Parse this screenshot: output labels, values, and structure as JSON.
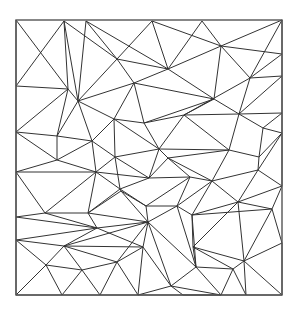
{
  "diagram": {
    "type": "triangulation-mesh",
    "canvas": {
      "width": 299,
      "height": 313
    },
    "colors": {
      "background": "#ffffff",
      "edge": "#333333",
      "border": "#555555"
    },
    "border": {
      "x": 16,
      "y": 20,
      "width": 266,
      "height": 275
    },
    "vertices": [
      [
        16,
        20
      ],
      [
        64,
        21
      ],
      [
        86,
        21
      ],
      [
        152,
        21
      ],
      [
        202,
        21
      ],
      [
        282,
        20
      ],
      [
        16,
        86
      ],
      [
        68,
        89
      ],
      [
        78,
        101
      ],
      [
        117,
        59
      ],
      [
        168,
        69
      ],
      [
        134,
        83
      ],
      [
        221,
        46
      ],
      [
        282,
        54
      ],
      [
        250,
        78
      ],
      [
        282,
        76
      ],
      [
        214,
        99
      ],
      [
        16,
        132
      ],
      [
        57,
        136
      ],
      [
        92,
        141
      ],
      [
        57,
        160
      ],
      [
        16,
        172
      ],
      [
        96,
        172
      ],
      [
        114,
        119
      ],
      [
        144,
        123
      ],
      [
        184,
        115
      ],
      [
        159,
        149
      ],
      [
        115,
        157
      ],
      [
        168,
        158
      ],
      [
        149,
        178
      ],
      [
        190,
        177
      ],
      [
        120,
        189
      ],
      [
        239,
        114
      ],
      [
        282,
        113
      ],
      [
        263,
        128
      ],
      [
        282,
        133
      ],
      [
        229,
        150
      ],
      [
        259,
        157
      ],
      [
        258,
        170
      ],
      [
        282,
        186
      ],
      [
        212,
        181
      ],
      [
        16,
        217
      ],
      [
        45,
        213
      ],
      [
        88,
        213
      ],
      [
        16,
        240
      ],
      [
        64,
        246
      ],
      [
        46,
        265
      ],
      [
        82,
        270
      ],
      [
        16,
        295
      ],
      [
        62,
        295
      ],
      [
        100,
        295
      ],
      [
        97,
        228
      ],
      [
        121,
        191
      ],
      [
        146,
        206
      ],
      [
        177,
        206
      ],
      [
        192,
        215
      ],
      [
        148,
        222
      ],
      [
        143,
        247
      ],
      [
        117,
        262
      ],
      [
        196,
        267
      ],
      [
        171,
        286
      ],
      [
        138,
        295
      ],
      [
        183,
        295
      ],
      [
        238,
        202
      ],
      [
        272,
        209
      ],
      [
        193,
        247
      ],
      [
        244,
        261
      ],
      [
        282,
        243
      ],
      [
        233,
        269
      ],
      [
        221,
        295
      ],
      [
        246,
        295
      ],
      [
        282,
        295
      ]
    ],
    "edges": [
      [
        0,
        7
      ],
      [
        0,
        6
      ],
      [
        1,
        6
      ],
      [
        1,
        7
      ],
      [
        1,
        8
      ],
      [
        1,
        9
      ],
      [
        2,
        8
      ],
      [
        2,
        10
      ],
      [
        2,
        9
      ],
      [
        3,
        9
      ],
      [
        3,
        10
      ],
      [
        4,
        10
      ],
      [
        4,
        12
      ],
      [
        3,
        12
      ],
      [
        5,
        12
      ],
      [
        5,
        13
      ],
      [
        12,
        13
      ],
      [
        12,
        14
      ],
      [
        13,
        14
      ],
      [
        14,
        15
      ],
      [
        5,
        14
      ],
      [
        12,
        16
      ],
      [
        10,
        12
      ],
      [
        10,
        16
      ],
      [
        9,
        10
      ],
      [
        9,
        11
      ],
      [
        10,
        11
      ],
      [
        11,
        16
      ],
      [
        8,
        11
      ],
      [
        8,
        9
      ],
      [
        7,
        8
      ],
      [
        6,
        7
      ],
      [
        6,
        17
      ],
      [
        7,
        17
      ],
      [
        7,
        18
      ],
      [
        8,
        18
      ],
      [
        8,
        19
      ],
      [
        8,
        23
      ],
      [
        11,
        23
      ],
      [
        11,
        24
      ],
      [
        16,
        24
      ],
      [
        16,
        25
      ],
      [
        14,
        25
      ],
      [
        14,
        32
      ],
      [
        15,
        32
      ],
      [
        13,
        15
      ],
      [
        15,
        33
      ],
      [
        32,
        33
      ],
      [
        25,
        32
      ],
      [
        16,
        32
      ],
      [
        24,
        25
      ],
      [
        23,
        24
      ],
      [
        19,
        23
      ],
      [
        18,
        19
      ],
      [
        17,
        18
      ],
      [
        17,
        20
      ],
      [
        18,
        20
      ],
      [
        19,
        20
      ],
      [
        19,
        22
      ],
      [
        20,
        22
      ],
      [
        20,
        21
      ],
      [
        21,
        22
      ],
      [
        17,
        21
      ],
      [
        23,
        27
      ],
      [
        19,
        27
      ],
      [
        22,
        27
      ],
      [
        23,
        26
      ],
      [
        24,
        26
      ],
      [
        25,
        26
      ],
      [
        26,
        27
      ],
      [
        26,
        28
      ],
      [
        25,
        36
      ],
      [
        26,
        36
      ],
      [
        32,
        36
      ],
      [
        32,
        34
      ],
      [
        33,
        34
      ],
      [
        34,
        35
      ],
      [
        33,
        35
      ],
      [
        34,
        37
      ],
      [
        36,
        37
      ],
      [
        35,
        37
      ],
      [
        35,
        38
      ],
      [
        37,
        38
      ],
      [
        38,
        39
      ],
      [
        35,
        39
      ],
      [
        36,
        40
      ],
      [
        28,
        36
      ],
      [
        28,
        40
      ],
      [
        26,
        29
      ],
      [
        28,
        29
      ],
      [
        27,
        29
      ],
      [
        22,
        29
      ],
      [
        27,
        31
      ],
      [
        29,
        31
      ],
      [
        22,
        31
      ],
      [
        29,
        30
      ],
      [
        28,
        30
      ],
      [
        30,
        40
      ],
      [
        38,
        40
      ],
      [
        30,
        54
      ],
      [
        40,
        54
      ],
      [
        40,
        55
      ],
      [
        55,
        63
      ],
      [
        40,
        63
      ],
      [
        38,
        63
      ],
      [
        39,
        63
      ],
      [
        39,
        64
      ],
      [
        63,
        64
      ],
      [
        21,
        42
      ],
      [
        21,
        41
      ],
      [
        42,
        41
      ],
      [
        22,
        42
      ],
      [
        22,
        43
      ],
      [
        42,
        43
      ],
      [
        31,
        43
      ],
      [
        31,
        52
      ],
      [
        43,
        52
      ],
      [
        52,
        53
      ],
      [
        31,
        53
      ],
      [
        30,
        53
      ],
      [
        53,
        54
      ],
      [
        54,
        55
      ],
      [
        52,
        56
      ],
      [
        53,
        56
      ],
      [
        54,
        56
      ],
      [
        43,
        56
      ],
      [
        43,
        51
      ],
      [
        51,
        56
      ],
      [
        42,
        51
      ],
      [
        41,
        51
      ],
      [
        41,
        44
      ],
      [
        44,
        51
      ],
      [
        44,
        45
      ],
      [
        45,
        51
      ],
      [
        45,
        56
      ],
      [
        51,
        57
      ],
      [
        56,
        57
      ],
      [
        45,
        57
      ],
      [
        45,
        58
      ],
      [
        57,
        58
      ],
      [
        44,
        46
      ],
      [
        45,
        46
      ],
      [
        46,
        47
      ],
      [
        45,
        47
      ],
      [
        47,
        58
      ],
      [
        46,
        48
      ],
      [
        44,
        48
      ],
      [
        46,
        49
      ],
      [
        47,
        49
      ],
      [
        47,
        50
      ],
      [
        58,
        50
      ],
      [
        58,
        61
      ],
      [
        57,
        61
      ],
      [
        57,
        60
      ],
      [
        56,
        60
      ],
      [
        60,
        61
      ],
      [
        60,
        62
      ],
      [
        59,
        60
      ],
      [
        56,
        59
      ],
      [
        55,
        59
      ],
      [
        55,
        65
      ],
      [
        59,
        65
      ],
      [
        63,
        65
      ],
      [
        63,
        66
      ],
      [
        64,
        66
      ],
      [
        64,
        67
      ],
      [
        66,
        67
      ],
      [
        65,
        66
      ],
      [
        65,
        68
      ],
      [
        66,
        68
      ],
      [
        59,
        68
      ],
      [
        59,
        69
      ],
      [
        68,
        69
      ],
      [
        60,
        69
      ],
      [
        68,
        70
      ],
      [
        66,
        70
      ],
      [
        67,
        71
      ],
      [
        66,
        71
      ],
      [
        62,
        69
      ],
      [
        48,
        49
      ],
      [
        49,
        50
      ],
      [
        50,
        61
      ],
      [
        61,
        62
      ],
      [
        62,
        69
      ],
      [
        69,
        70
      ],
      [
        70,
        71
      ],
      [
        56,
        58
      ],
      [
        54,
        59
      ],
      [
        55,
        64
      ]
    ]
  }
}
